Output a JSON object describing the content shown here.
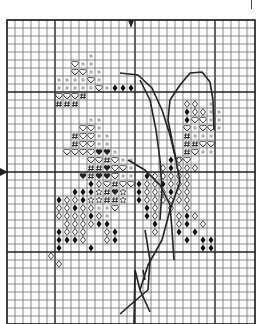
{
  "pattern": {
    "title": "Cross-stitch chart",
    "grid": {
      "origin_x": 7,
      "origin_y": 20,
      "cell": 8,
      "cols": 31,
      "rows": 38,
      "bold_every": 10,
      "bold_col_offset": 6,
      "bold_row_offset": 9,
      "line_color": "#555555",
      "bold_color": "#222222"
    },
    "center_markers": {
      "top_col_x": 131,
      "left_row_y": 172
    },
    "symbols": {
      "heart": "open heart",
      "sq": "small grey square",
      "dia": "open diamond",
      "ddia": "filled diamond",
      "hash": "hash mark",
      "fheart": "filled heart",
      "star": "open star",
      "dot": "filled circle"
    },
    "cells": [
      [
        10,
        4,
        "sq"
      ],
      [
        8,
        5,
        "heart"
      ],
      [
        9,
        5,
        "sq"
      ],
      [
        10,
        5,
        "sq"
      ],
      [
        8,
        6,
        "heart"
      ],
      [
        9,
        6,
        "heart"
      ],
      [
        10,
        6,
        "sq"
      ],
      [
        11,
        6,
        "sq"
      ],
      [
        6,
        7,
        "sq"
      ],
      [
        7,
        7,
        "sq"
      ],
      [
        8,
        7,
        "sq"
      ],
      [
        9,
        7,
        "sq"
      ],
      [
        10,
        7,
        "heart"
      ],
      [
        11,
        7,
        "sq"
      ],
      [
        6,
        8,
        "sq"
      ],
      [
        7,
        8,
        "sq"
      ],
      [
        8,
        8,
        "sq"
      ],
      [
        9,
        8,
        "sq"
      ],
      [
        10,
        8,
        "sq"
      ],
      [
        11,
        8,
        "heart"
      ],
      [
        12,
        8,
        "sq"
      ],
      [
        13,
        8,
        "ddia"
      ],
      [
        14,
        8,
        "ddia"
      ],
      [
        15,
        8,
        "ddia"
      ],
      [
        6,
        9,
        "heart"
      ],
      [
        7,
        9,
        "heart"
      ],
      [
        8,
        9,
        "heart"
      ],
      [
        9,
        9,
        "hash"
      ],
      [
        6,
        10,
        "hash"
      ],
      [
        7,
        10,
        "hash"
      ],
      [
        8,
        10,
        "hash"
      ],
      [
        22,
        10,
        "dia"
      ],
      [
        23,
        10,
        "dia"
      ],
      [
        25,
        10,
        "sq"
      ],
      [
        22,
        11,
        "ddia"
      ],
      [
        23,
        11,
        "dia"
      ],
      [
        24,
        11,
        "dia"
      ],
      [
        25,
        11,
        "sq"
      ],
      [
        26,
        11,
        "sq"
      ],
      [
        22,
        12,
        "ddia"
      ],
      [
        23,
        12,
        "heart"
      ],
      [
        24,
        12,
        "heart"
      ],
      [
        25,
        12,
        "sq"
      ],
      [
        26,
        12,
        "sq"
      ],
      [
        22,
        13,
        "heart"
      ],
      [
        23,
        13,
        "sq"
      ],
      [
        24,
        13,
        "heart"
      ],
      [
        25,
        13,
        "heart"
      ],
      [
        26,
        13,
        "sq"
      ],
      [
        10,
        12,
        "sq"
      ],
      [
        11,
        12,
        "sq"
      ],
      [
        9,
        13,
        "heart"
      ],
      [
        10,
        13,
        "heart"
      ],
      [
        11,
        13,
        "sq"
      ],
      [
        8,
        14,
        "hash"
      ],
      [
        9,
        14,
        "heart"
      ],
      [
        10,
        14,
        "heart"
      ],
      [
        11,
        14,
        "sq"
      ],
      [
        12,
        14,
        "sq"
      ],
      [
        22,
        14,
        "hash"
      ],
      [
        23,
        14,
        "sq"
      ],
      [
        24,
        14,
        "sq"
      ],
      [
        25,
        14,
        "sq"
      ],
      [
        8,
        15,
        "hash"
      ],
      [
        9,
        15,
        "heart"
      ],
      [
        10,
        15,
        "heart"
      ],
      [
        11,
        15,
        "sq"
      ],
      [
        12,
        15,
        "sq"
      ],
      [
        22,
        15,
        "hash"
      ],
      [
        23,
        15,
        "hash"
      ],
      [
        24,
        15,
        "heart"
      ],
      [
        25,
        15,
        "heart"
      ],
      [
        7,
        16,
        "heart"
      ],
      [
        8,
        16,
        "heart"
      ],
      [
        9,
        16,
        "heart"
      ],
      [
        10,
        16,
        "heart"
      ],
      [
        11,
        16,
        "fheart"
      ],
      [
        12,
        16,
        "fheart"
      ],
      [
        13,
        16,
        "sq"
      ],
      [
        22,
        16,
        "hash"
      ],
      [
        23,
        16,
        "heart"
      ],
      [
        24,
        16,
        "sq"
      ],
      [
        25,
        16,
        "sq"
      ],
      [
        21,
        17,
        "heart"
      ],
      [
        22,
        17,
        "heart"
      ],
      [
        10,
        17,
        "heart"
      ],
      [
        11,
        17,
        "heart"
      ],
      [
        12,
        17,
        "hash"
      ],
      [
        13,
        17,
        "heart"
      ],
      [
        14,
        17,
        "sq"
      ],
      [
        15,
        17,
        "sq"
      ],
      [
        10,
        18,
        "hash"
      ],
      [
        11,
        18,
        "hash"
      ],
      [
        12,
        18,
        "fheart"
      ],
      [
        13,
        18,
        "heart"
      ],
      [
        14,
        18,
        "heart"
      ],
      [
        15,
        18,
        "sq"
      ],
      [
        9,
        19,
        "fheart"
      ],
      [
        10,
        19,
        "hash"
      ],
      [
        11,
        19,
        "fheart"
      ],
      [
        12,
        19,
        "fheart"
      ],
      [
        13,
        19,
        "heart"
      ],
      [
        14,
        19,
        "sq"
      ],
      [
        15,
        19,
        "sq"
      ],
      [
        10,
        20,
        "ddia"
      ],
      [
        11,
        20,
        "dia"
      ],
      [
        12,
        20,
        "heart"
      ],
      [
        13,
        20,
        "hash"
      ],
      [
        14,
        20,
        "heart"
      ],
      [
        15,
        20,
        "heart"
      ],
      [
        8,
        21,
        "ddia"
      ],
      [
        9,
        21,
        "ddia"
      ],
      [
        10,
        21,
        "ddia"
      ],
      [
        11,
        21,
        "star"
      ],
      [
        12,
        21,
        "hash"
      ],
      [
        13,
        21,
        "fheart"
      ],
      [
        14,
        21,
        "star"
      ],
      [
        6,
        22,
        "ddia"
      ],
      [
        7,
        22,
        "dia"
      ],
      [
        8,
        22,
        "dia"
      ],
      [
        9,
        22,
        "ddia"
      ],
      [
        10,
        22,
        "star"
      ],
      [
        11,
        22,
        "star"
      ],
      [
        12,
        22,
        "hash"
      ],
      [
        13,
        22,
        "hash"
      ],
      [
        14,
        22,
        "star"
      ],
      [
        6,
        23,
        "dia"
      ],
      [
        7,
        23,
        "dia"
      ],
      [
        8,
        23,
        "ddia"
      ],
      [
        9,
        23,
        "dia"
      ],
      [
        10,
        23,
        "dia"
      ],
      [
        11,
        23,
        "sq"
      ],
      [
        12,
        23,
        "sq"
      ],
      [
        13,
        23,
        "heart"
      ],
      [
        6,
        24,
        "dia"
      ],
      [
        7,
        24,
        "dia"
      ],
      [
        8,
        24,
        "dia"
      ],
      [
        9,
        24,
        "dia"
      ],
      [
        10,
        24,
        "ddia"
      ],
      [
        11,
        24,
        "dia"
      ],
      [
        12,
        24,
        "sq"
      ],
      [
        7,
        25,
        "dia"
      ],
      [
        8,
        25,
        "dia"
      ],
      [
        9,
        25,
        "dia"
      ],
      [
        10,
        25,
        "dia"
      ],
      [
        11,
        25,
        "ddia"
      ],
      [
        12,
        25,
        "ddia"
      ],
      [
        6,
        26,
        "ddia"
      ],
      [
        7,
        26,
        "dia"
      ],
      [
        8,
        26,
        "dia"
      ],
      [
        9,
        26,
        "dia"
      ],
      [
        12,
        26,
        "dia"
      ],
      [
        13,
        26,
        "ddia"
      ],
      [
        6,
        27,
        "ddia"
      ],
      [
        7,
        27,
        "ddia"
      ],
      [
        8,
        27,
        "ddia"
      ],
      [
        9,
        27,
        "dia"
      ],
      [
        12,
        27,
        "dia"
      ],
      [
        13,
        27,
        "ddia"
      ],
      [
        6,
        28,
        "ddia"
      ],
      [
        10,
        28,
        "ddia"
      ],
      [
        5,
        29,
        "dia"
      ],
      [
        6,
        30,
        "dia"
      ],
      [
        20,
        17,
        "ddia"
      ],
      [
        21,
        17,
        "dia"
      ],
      [
        19,
        18,
        "dia"
      ],
      [
        20,
        18,
        "ddia"
      ],
      [
        21,
        18,
        "dia"
      ],
      [
        22,
        18,
        "dia"
      ],
      [
        23,
        18,
        "dia"
      ],
      [
        17,
        19,
        "ddia"
      ],
      [
        18,
        19,
        "dia"
      ],
      [
        19,
        19,
        "dia"
      ],
      [
        20,
        19,
        "dia"
      ],
      [
        21,
        19,
        "dia"
      ],
      [
        22,
        19,
        "dia"
      ],
      [
        16,
        20,
        "ddia"
      ],
      [
        17,
        20,
        "dia"
      ],
      [
        18,
        20,
        "dia"
      ],
      [
        19,
        20,
        "ddia"
      ],
      [
        20,
        20,
        "dia"
      ],
      [
        21,
        20,
        "dia"
      ],
      [
        22,
        20,
        "dia"
      ],
      [
        16,
        21,
        "ddia"
      ],
      [
        17,
        21,
        "dia"
      ],
      [
        18,
        21,
        "dia"
      ],
      [
        19,
        21,
        "dia"
      ],
      [
        20,
        21,
        "ddia"
      ],
      [
        21,
        21,
        "dia"
      ],
      [
        22,
        21,
        "dia"
      ],
      [
        16,
        22,
        "ddia"
      ],
      [
        17,
        22,
        "dia"
      ],
      [
        18,
        22,
        "dia"
      ],
      [
        19,
        22,
        "dia"
      ],
      [
        20,
        22,
        "dia"
      ],
      [
        21,
        22,
        "dia"
      ],
      [
        22,
        22,
        "dia"
      ],
      [
        17,
        23,
        "ddia"
      ],
      [
        18,
        23,
        "dia"
      ],
      [
        20,
        23,
        "dia"
      ],
      [
        22,
        23,
        "dia"
      ],
      [
        17,
        24,
        "ddia"
      ],
      [
        18,
        24,
        "dia"
      ],
      [
        21,
        24,
        "dia"
      ],
      [
        22,
        24,
        "ddia"
      ],
      [
        23,
        24,
        "dia"
      ],
      [
        18,
        25,
        "ddia"
      ],
      [
        21,
        25,
        "dia"
      ],
      [
        22,
        25,
        "ddia"
      ],
      [
        24,
        25,
        "dia"
      ],
      [
        18,
        26,
        "dia"
      ],
      [
        21,
        26,
        "ddia"
      ],
      [
        23,
        26,
        "ddia"
      ],
      [
        22,
        27,
        "ddia"
      ],
      [
        24,
        27,
        "ddia"
      ],
      [
        25,
        27,
        "ddia"
      ],
      [
        24,
        28,
        "ddia"
      ],
      [
        25,
        28,
        "ddia"
      ]
    ],
    "backstitch": [
      [
        [
          120,
          73
        ],
        [
          138,
          75
        ],
        [
          152,
          88
        ],
        [
          162,
          110
        ],
        [
          170,
          135
        ],
        [
          176,
          160
        ],
        [
          180,
          182
        ]
      ],
      [
        [
          176,
          160
        ],
        [
          172,
          140
        ],
        [
          168,
          120
        ],
        [
          170,
          100
        ],
        [
          180,
          85
        ],
        [
          190,
          73
        ],
        [
          202,
          72
        ],
        [
          210,
          82
        ],
        [
          213,
          100
        ],
        [
          214,
          130
        ]
      ],
      [
        [
          128,
          160
        ],
        [
          145,
          170
        ],
        [
          160,
          185
        ],
        [
          170,
          205
        ],
        [
          172,
          230
        ],
        [
          174,
          260
        ]
      ],
      [
        [
          180,
          182
        ],
        [
          170,
          210
        ],
        [
          162,
          240
        ],
        [
          148,
          265
        ],
        [
          140,
          290
        ]
      ],
      [
        [
          140,
          80
        ],
        [
          150,
          100
        ],
        [
          156,
          130
        ],
        [
          160,
          160
        ],
        [
          162,
          190
        ],
        [
          160,
          220
        ]
      ],
      [
        [
          145,
          230
        ],
        [
          150,
          260
        ],
        [
          148,
          290
        ]
      ],
      [
        [
          148,
          290
        ],
        [
          136,
          300
        ],
        [
          120,
          314
        ]
      ],
      [
        [
          135,
          270
        ],
        [
          140,
          290
        ],
        [
          150,
          312
        ]
      ],
      [
        [
          135,
          270
        ],
        [
          134,
          324
        ]
      ],
      [
        [
          143,
          270
        ],
        [
          145,
          280
        ]
      ]
    ]
  }
}
